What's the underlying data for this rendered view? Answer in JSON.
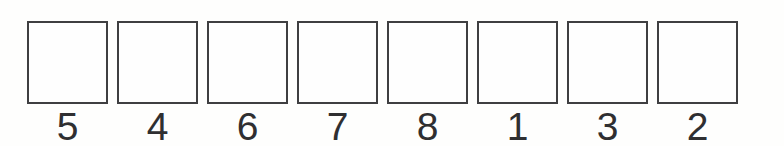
{
  "figure": {
    "kind": "empty-box-sequence",
    "background_color": "#fefefd",
    "border_color": "#3f3f41",
    "label_color": "#2f2f31",
    "box_count": 8,
    "boxes": [
      {
        "label": "5"
      },
      {
        "label": "4"
      },
      {
        "label": "6"
      },
      {
        "label": "7"
      },
      {
        "label": "8"
      },
      {
        "label": "1"
      },
      {
        "label": "3"
      },
      {
        "label": "2"
      }
    ]
  }
}
